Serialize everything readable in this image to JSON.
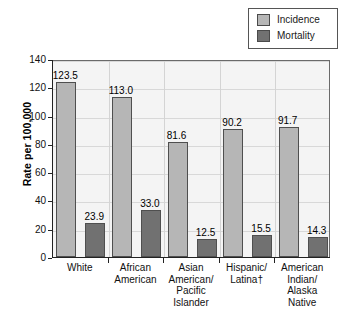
{
  "chart_data": {
    "type": "bar",
    "title": "",
    "subtitle": "",
    "xlabel": "",
    "ylabel": "Rate per 100,000",
    "ylim": [
      0,
      140
    ],
    "ytick_step": 20,
    "yticks": [
      "0",
      "20",
      "40",
      "60",
      "80",
      "100",
      "120",
      "140"
    ],
    "grid": true,
    "legend_position": "top-right",
    "categories": [
      "White",
      "African\nAmerican",
      "Asian\nAmerican/\nPacific\nIslander",
      "Hispanic/\nLatina†",
      "American\nIndian/\nAlaska\nNative"
    ],
    "series": [
      {
        "name": "Incidence",
        "color": "#b6b6b6",
        "values": [
          123.5,
          113.0,
          81.6,
          90.2,
          91.7
        ],
        "labels": [
          "123.5",
          "113.0",
          "81.6",
          "90.2",
          "91.7"
        ]
      },
      {
        "name": "Mortality",
        "color": "#717171",
        "values": [
          23.9,
          33.0,
          12.5,
          15.5,
          14.3
        ],
        "labels": [
          "23.9",
          "33.0",
          "12.5",
          "15.5",
          "14.3"
        ]
      }
    ]
  },
  "legend": {
    "items": [
      {
        "label": "Incidence",
        "color": "#b6b6b6"
      },
      {
        "label": "Mortality",
        "color": "#717171"
      }
    ]
  },
  "axis": {
    "y_title": "Rate per 100,000"
  }
}
